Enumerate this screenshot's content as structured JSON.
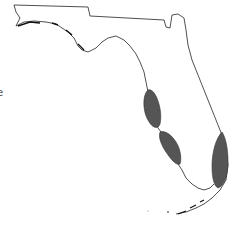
{
  "map": {
    "region": "Florida",
    "outline_color": "#222222",
    "shade_color": "#555555",
    "shaded_regions": [
      {
        "name": "west-coast-north-region",
        "approx_center": [
          152,
          105
        ]
      },
      {
        "name": "west-coast-south-region",
        "approx_center": [
          170,
          148
        ]
      },
      {
        "name": "east-coast-southeast-region",
        "approx_center": [
          216,
          160
        ]
      }
    ],
    "edge_label": "e"
  }
}
